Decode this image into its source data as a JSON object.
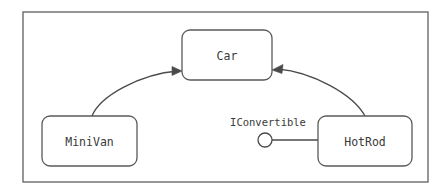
{
  "diagram": {
    "type": "uml-class-diagram",
    "frame": {
      "name": "diagram-frame",
      "x": 23,
      "y": 12,
      "width": 405,
      "height": 170
    },
    "stroke_color": "#4a4a4a",
    "frame_color": "#6b6b6b",
    "background_color": "#ffffff",
    "text_color": "#3a3a3a",
    "classes": [
      {
        "id": "car",
        "label": "Car",
        "x": 182,
        "y": 30,
        "width": 90,
        "height": 50,
        "corner_radius": 8
      },
      {
        "id": "minivan",
        "label": "MiniVan",
        "x": 42,
        "y": 116,
        "width": 95,
        "height": 50,
        "corner_radius": 8
      },
      {
        "id": "hotrod",
        "label": "HotRod",
        "x": 318,
        "y": 116,
        "width": 94,
        "height": 50,
        "corner_radius": 8
      }
    ],
    "interfaces": [
      {
        "id": "iconvertible",
        "label": "IConvertible",
        "label_x": 268,
        "label_y": 126,
        "ball_cx": 265,
        "ball_cy": 140,
        "ball_r": 7,
        "stem_x1": 272,
        "stem_x2": 318,
        "stem_y": 140,
        "realized_by": "HotRod"
      }
    ],
    "relationships": [
      {
        "id": "minivan-inherits-car",
        "kind": "generalization",
        "from": "MiniVan",
        "to": "Car",
        "path": "M 92 116 C 100 96 140 74 178 71",
        "arrow_points": "182,71 172,66.5 172,75.5"
      },
      {
        "id": "hotrod-inherits-car",
        "kind": "generalization",
        "from": "HotRod",
        "to": "Car",
        "path": "M 365 116 C 353 94 312 72 278 69",
        "arrow_points": "272,70 283,64.5 282,73.5"
      }
    ]
  }
}
